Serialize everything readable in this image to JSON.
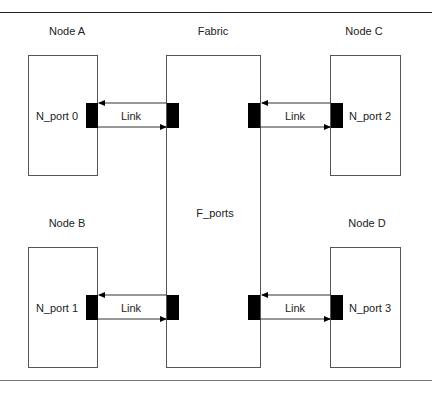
{
  "diagram": {
    "fabric": {
      "title": "Fabric",
      "ports_label": "F_ports"
    },
    "nodes": [
      {
        "title": "Node A",
        "port_label": "N_port 0",
        "link_label": "Link"
      },
      {
        "title": "Node B",
        "port_label": "N_port 1",
        "link_label": "Link"
      },
      {
        "title": "Node C",
        "port_label": "N_port 2",
        "link_label": "Link"
      },
      {
        "title": "Node D",
        "port_label": "N_port 3",
        "link_label": "Link"
      }
    ]
  }
}
